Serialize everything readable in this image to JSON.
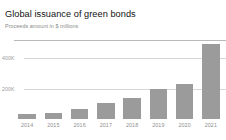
{
  "chart_data": {
    "type": "bar",
    "title": "Global issuance of green bonds",
    "subtitle": "Proceeds amount in $ millions",
    "xlabel": "",
    "ylabel": "",
    "categories": [
      "2014",
      "2015",
      "2016",
      "2017",
      "2018",
      "2019",
      "2020",
      "2021"
    ],
    "values": [
      33000,
      43000,
      63000,
      107000,
      140000,
      197000,
      233000,
      493000
    ],
    "ylim": [
      0,
      520000
    ],
    "yticks": [
      200000,
      400000
    ],
    "ytick_labels": [
      "200K",
      "400K"
    ],
    "grid": true,
    "legend": false,
    "legend_position": "none",
    "series": [
      {
        "name": "Proceeds amount",
        "values": [
          33000,
          43000,
          63000,
          107000,
          140000,
          197000,
          233000,
          493000
        ]
      }
    ],
    "bar_color": "#9b9b9b",
    "gridline_color": "#d6d6d6",
    "background_color": "#ffffff"
  },
  "header": {
    "title": "Global issuance of green bonds",
    "subtitle": "Proceeds amount in $ millions"
  }
}
